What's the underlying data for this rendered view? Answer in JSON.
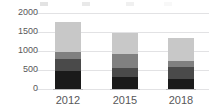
{
  "chart_data": {
    "type": "bar",
    "stacked": true,
    "title": "",
    "subtitle": "",
    "xlabel": "",
    "ylabel": "",
    "categories": [
      "2012",
      "2015",
      "2018"
    ],
    "ylim": [
      0,
      2000
    ],
    "yticks": [
      0,
      500,
      1000,
      1500,
      2000
    ],
    "ytick_labels": [
      "0",
      "500",
      "1000",
      "1500",
      "2000"
    ],
    "grid": true,
    "legend_position": "top",
    "series": [
      {
        "name": "Series 1",
        "color": "#1a1a1a",
        "values": [
          480,
          310,
          270
        ]
      },
      {
        "name": "Series 2",
        "color": "#4a4a4a",
        "values": [
          310,
          240,
          300
        ]
      },
      {
        "name": "Series 3",
        "color": "#808080",
        "values": [
          180,
          370,
          160
        ]
      },
      {
        "name": "Series 4",
        "color": "#c8c8c8",
        "values": [
          800,
          560,
          620
        ]
      }
    ],
    "totals": [
      1770,
      1480,
      1350
    ]
  },
  "axis": {
    "y_labels": [
      "2000",
      "1500",
      "1000",
      "500",
      "0"
    ],
    "x_labels": [
      "2012",
      "2015",
      "2018"
    ]
  },
  "legend": {
    "clipped": true,
    "items": [
      {
        "label": "",
        "color": "#1a1a1a"
      },
      {
        "label": "",
        "color": "#4a4a4a"
      },
      {
        "label": "",
        "color": "#808080"
      },
      {
        "label": "",
        "color": "#c8c8c8"
      }
    ]
  },
  "colors": {
    "gridline": "#e2e2e4",
    "axis_text": "#58585a",
    "background": "#ffffff"
  }
}
